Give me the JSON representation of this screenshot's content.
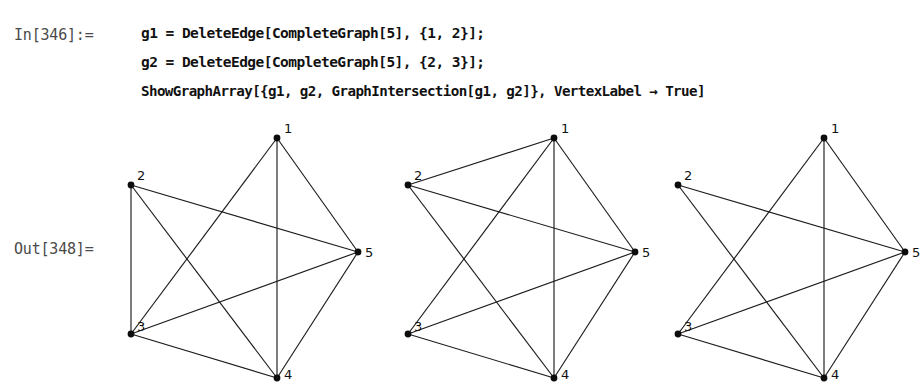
{
  "notebook": {
    "input_label": "In[346]:=",
    "output_label": "Out[348]=",
    "code_lines": [
      "g1 = DeleteEdge[CompleteGraph[5], {1, 2}];",
      "g2 = DeleteEdge[CompleteGraph[5], {2, 3}];",
      "ShowGraphArray[{g1, g2, GraphIntersection[g1, g2]}, VertexLabel → True]"
    ]
  },
  "colors": {
    "edge": "#1c1c1c",
    "vertex": "#0d0d0d",
    "label_text": "#4a4a4a",
    "code_text": "#111111",
    "background": "#ffffff"
  },
  "graph_layout": {
    "vertices": [
      {
        "id": "1",
        "x": 182,
        "y": 26,
        "label_dx": 7,
        "label_dy": -5
      },
      {
        "id": "2",
        "x": 36,
        "y": 73,
        "label_dx": 6,
        "label_dy": -5
      },
      {
        "id": "3",
        "x": 36,
        "y": 222,
        "label_dx": 6,
        "label_dy": -3
      },
      {
        "id": "4",
        "x": 182,
        "y": 266,
        "label_dx": 7,
        "label_dy": 1
      },
      {
        "id": "5",
        "x": 263,
        "y": 140,
        "label_dx": 7,
        "label_dy": 5
      }
    ]
  },
  "graphs": [
    {
      "name": "g1",
      "caption": "K5 minus edge {1,2}",
      "edge_count": 9,
      "edges": [
        [
          "1",
          "3"
        ],
        [
          "1",
          "4"
        ],
        [
          "1",
          "5"
        ],
        [
          "2",
          "3"
        ],
        [
          "2",
          "4"
        ],
        [
          "2",
          "5"
        ],
        [
          "3",
          "4"
        ],
        [
          "3",
          "5"
        ],
        [
          "4",
          "5"
        ]
      ]
    },
    {
      "name": "g2",
      "caption": "K5 minus edge {2,3}",
      "edge_count": 9,
      "edges": [
        [
          "1",
          "2"
        ],
        [
          "1",
          "3"
        ],
        [
          "1",
          "4"
        ],
        [
          "1",
          "5"
        ],
        [
          "2",
          "4"
        ],
        [
          "2",
          "5"
        ],
        [
          "3",
          "4"
        ],
        [
          "3",
          "5"
        ],
        [
          "4",
          "5"
        ]
      ]
    },
    {
      "name": "GraphIntersection[g1, g2]",
      "caption": "K5 minus edges {1,2} and {2,3}",
      "edge_count": 8,
      "edges": [
        [
          "1",
          "3"
        ],
        [
          "1",
          "4"
        ],
        [
          "1",
          "5"
        ],
        [
          "2",
          "4"
        ],
        [
          "2",
          "5"
        ],
        [
          "3",
          "4"
        ],
        [
          "3",
          "5"
        ],
        [
          "4",
          "5"
        ]
      ]
    }
  ]
}
